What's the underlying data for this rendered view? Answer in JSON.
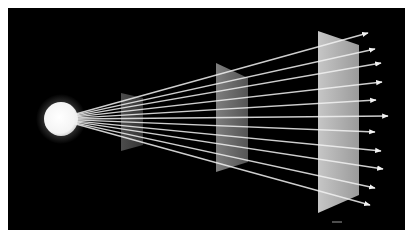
{
  "diagram": {
    "colors": {
      "page": "#ffffff",
      "background": "#000000",
      "ray": "#f2f2f2",
      "source": "#ffffff",
      "source_glow": "#bfbfbf"
    },
    "frame": {
      "x": 8,
      "y": 8,
      "w": 397,
      "h": 222
    },
    "source": {
      "cx": 61,
      "cy": 119,
      "r": 17,
      "ray_origin": [
        74,
        119
      ]
    },
    "planes": [
      {
        "name": "plane-near",
        "points": [
          [
            121,
            93
          ],
          [
            143,
            98
          ],
          [
            143,
            145
          ],
          [
            121,
            151
          ]
        ],
        "color_left": "#5a5a5a",
        "color_right": "#3e3e3e",
        "opacity": 0.85
      },
      {
        "name": "plane-middle",
        "points": [
          [
            216,
            63
          ],
          [
            248,
            78
          ],
          [
            248,
            162
          ],
          [
            216,
            172
          ]
        ],
        "color_left": "#8c8c8c",
        "color_right": "#5e5e5e",
        "opacity": 0.9
      },
      {
        "name": "plane-far",
        "points": [
          [
            318,
            31
          ],
          [
            359,
            45
          ],
          [
            359,
            195
          ],
          [
            318,
            213
          ]
        ],
        "color_left": "#d0d0d0",
        "color_right": "#a3a3a3",
        "opacity": 0.95
      }
    ],
    "rays": [
      [
        368,
        33
      ],
      [
        375,
        49
      ],
      [
        381,
        63
      ],
      [
        382,
        82
      ],
      [
        376,
        100
      ],
      [
        388,
        116
      ],
      [
        375,
        132
      ],
      [
        381,
        151
      ],
      [
        383,
        169
      ],
      [
        375,
        188
      ],
      [
        370,
        205
      ]
    ],
    "reflection_mark": {
      "x1": 332,
      "y1": 222,
      "x2": 342,
      "y2": 222
    }
  }
}
